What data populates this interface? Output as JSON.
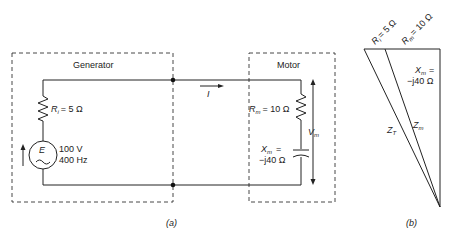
{
  "part_a": {
    "caption": "(a)",
    "generator": {
      "title": "Generator",
      "resistor_symbol": "R",
      "resistor_sub": "i",
      "resistor_value": "= 5 Ω",
      "source_symbol": "E",
      "source_voltage": "100 V",
      "source_frequency": "400 Hz"
    },
    "current_label": "I",
    "motor": {
      "title": "Motor",
      "resistor_symbol": "R",
      "resistor_sub": "m",
      "resistor_value": "= 10 Ω",
      "reactance_symbol": "X",
      "reactance_sub": "m",
      "reactance_eq": "=",
      "reactance_value": "−j40 Ω",
      "voltage_symbol": "V",
      "voltage_sub": "m"
    }
  },
  "part_b": {
    "caption": "(b)",
    "ri_label": "R",
    "ri_sub": "i",
    "ri_value": "= 5 Ω",
    "rm_label": "R",
    "rm_sub": "m",
    "rm_value": "= 10 Ω",
    "xm_label": "X",
    "xm_sub": "m",
    "xm_eq": "=",
    "xm_value": "−j40 Ω",
    "zt_label": "Z",
    "zt_sub": "T",
    "zm_label": "Z",
    "zm_sub": "m"
  }
}
